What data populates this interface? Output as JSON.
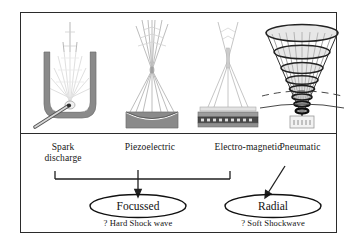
{
  "figure": {
    "type": "classification-diagram",
    "title_present": false,
    "panels": 2
  },
  "generators": [
    {
      "id": "spark-discharge",
      "label_line1": "Spark",
      "label_line2": "discharge",
      "label_full": "Spark discharge",
      "icon": "spark-discharge-reflector-icon",
      "description": "parabolic reflector with electrode and converging rays",
      "outcome": "Focussed"
    },
    {
      "id": "piezoelectric",
      "label_line1": "Piezoelectric",
      "label_line2": "",
      "label_full": "Piezoelectric",
      "icon": "piezoelectric-dish-icon",
      "description": "concave piezo dish with rays focusing to a point",
      "outcome": "Focussed"
    },
    {
      "id": "electro-magnetic",
      "label_line1": "Electro-magnetic",
      "label_line2": "",
      "label_full": "Electro-magnetic",
      "icon": "electromagnetic-coil-icon",
      "description": "flat stacked coil plates with converging beam",
      "outcome": "Focussed"
    },
    {
      "id": "pneumatic",
      "label_line1": "Pneumatic",
      "label_line2": "",
      "label_full": "Pneumatic",
      "icon": "pneumatic-cone-icon",
      "description": "radial cone wavefront mesh with dashed spreading arcs",
      "outcome": "Radial"
    }
  ],
  "outcomes": [
    {
      "id": "focussed",
      "label": "Focussed",
      "caption": "? Hard Shock wave",
      "shape": "ellipse",
      "fed_by": [
        "Spark discharge",
        "Piezoelectric",
        "Electro-magnetic"
      ],
      "connector": "bracket-with-down-arrow"
    },
    {
      "id": "radial",
      "label": "Radial",
      "caption": "? Soft Shockwave",
      "shape": "ellipse",
      "fed_by": [
        "Pneumatic"
      ],
      "connector": "diagonal-arrow"
    }
  ],
  "colors": {
    "frame": "#2b2b2b",
    "text": "#171717",
    "device_gray": "#8a8a8a",
    "device_gray_dark": "#6f6f6f",
    "wave_gray": "#b9b9b9",
    "background": "#ffffff"
  }
}
